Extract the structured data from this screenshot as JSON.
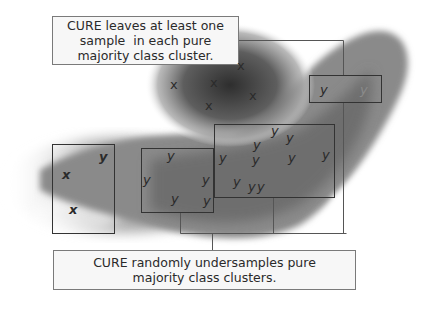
{
  "diagram": {
    "top_label": {
      "lines": [
        "CURE leaves at least one",
        "sample  in each pure",
        "majority class cluster."
      ]
    },
    "bottom_label": {
      "lines": [
        "CURE randomly undersamples pure",
        "majority class clusters."
      ]
    },
    "clusters": {
      "top_blob": {
        "class": "x",
        "symbols": [
          "x",
          "x",
          "x",
          "x",
          "x"
        ]
      },
      "left_box": {
        "symbols": [
          "y",
          "x",
          "x"
        ]
      },
      "middle_small_box": {
        "symbols": [
          "y",
          "y",
          "y",
          "y",
          "y"
        ]
      },
      "big_box": {
        "symbols": [
          "y",
          "y",
          "y",
          "y",
          "y",
          "y",
          "y",
          "y",
          "y",
          "y",
          "y"
        ]
      },
      "right_small_box": {
        "symbols": [
          "y",
          "y"
        ]
      }
    },
    "colors": {
      "blob_dark": "#3a3a3a",
      "blob_mid": "#8c8c8c",
      "box_border": "#333333",
      "label_bg": "#f7f7f7",
      "label_border": "#7a7a7a",
      "connector": "#555555"
    }
  }
}
